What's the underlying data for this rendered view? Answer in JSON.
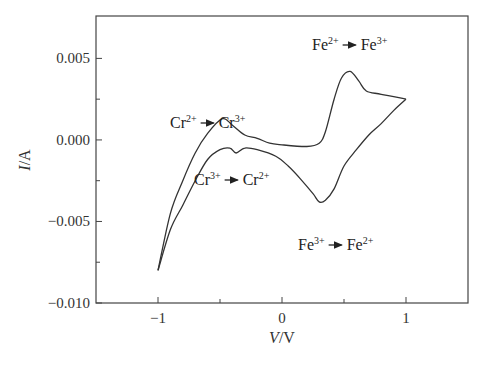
{
  "chart_data": {
    "type": "line",
    "title": "",
    "xlabel": "V/V",
    "ylabel": "I/A",
    "xlim": [
      -1.5,
      1.5
    ],
    "ylim": [
      -0.01,
      0.0076
    ],
    "grid": false,
    "legend": null,
    "x_ticks": [
      -1,
      0,
      1
    ],
    "x_tick_labels": [
      "−1",
      "0",
      "1"
    ],
    "y_ticks": [
      0.005,
      0.0,
      -0.005,
      -0.01
    ],
    "y_tick_labels": [
      "0.005",
      "0.000",
      "−0.005",
      "−0.010"
    ],
    "series": [
      {
        "name": "forward (anodic) sweep",
        "x": [
          -1.0,
          -0.9,
          -0.8,
          -0.7,
          -0.6,
          -0.48,
          -0.4,
          -0.3,
          -0.2,
          -0.1,
          0.0,
          0.2,
          0.3,
          0.35,
          0.42,
          0.48,
          0.55,
          0.62,
          0.68,
          0.8,
          1.0
        ],
        "y": [
          -0.008,
          -0.0045,
          -0.0025,
          -0.0008,
          0.0004,
          0.0013,
          0.0009,
          0.0003,
          0.0001,
          -0.0002,
          -0.0003,
          -0.0004,
          -0.0002,
          0.0005,
          0.0025,
          0.0038,
          0.0042,
          0.0036,
          0.003,
          0.0028,
          0.0025
        ]
      },
      {
        "name": "reverse (cathodic) sweep",
        "x": [
          1.0,
          0.9,
          0.8,
          0.7,
          0.6,
          0.5,
          0.42,
          0.35,
          0.3,
          0.25,
          0.15,
          0.05,
          -0.05,
          -0.2,
          -0.3,
          -0.37,
          -0.42,
          -0.5,
          -0.6,
          -0.7,
          -0.8,
          -0.9,
          -1.0
        ],
        "y": [
          0.0025,
          0.0018,
          0.001,
          0.0003,
          -0.0006,
          -0.0016,
          -0.003,
          -0.0037,
          -0.0038,
          -0.0033,
          -0.0024,
          -0.0016,
          -0.001,
          -0.0006,
          -0.0005,
          -0.0008,
          -0.0005,
          -0.0006,
          -0.0012,
          -0.0025,
          -0.004,
          -0.0055,
          -0.008
        ]
      }
    ],
    "annotations": [
      {
        "text": "Cr²⁺ → Cr³⁺",
        "x": -0.45,
        "y": 0.002
      },
      {
        "text": "Cr³⁺ → Cr²⁺",
        "x": -0.3,
        "y": -0.002
      },
      {
        "text": "Fe²⁺ → Fe³⁺",
        "x": 0.65,
        "y": 0.0058
      },
      {
        "text": "Fe³⁺ → Fe²⁺",
        "x": 0.6,
        "y": -0.0048
      }
    ]
  },
  "labels": {
    "xlabel_italic": "V",
    "xlabel_rest": "/V",
    "ylabel_italic": "I",
    "ylabel_rest": "/A",
    "annot": [
      {
        "a": "Cr",
        "as": "2+",
        "b": "Cr",
        "bs": "3+"
      },
      {
        "a": "Cr",
        "as": "3+",
        "b": "Cr",
        "bs": "2+"
      },
      {
        "a": "Fe",
        "as": "2+",
        "b": "Fe",
        "bs": "3+"
      },
      {
        "a": "Fe",
        "as": "3+",
        "b": "Fe",
        "bs": "2+"
      }
    ]
  }
}
